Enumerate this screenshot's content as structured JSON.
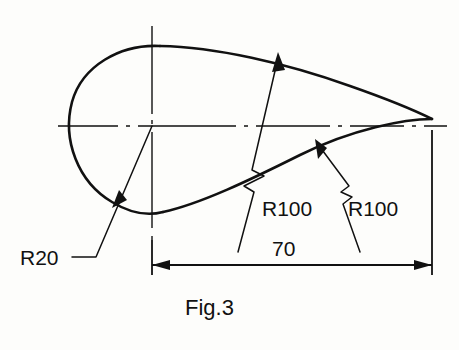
{
  "figure": {
    "caption": "Fig.3",
    "background_color": "#fdfdfb",
    "line_color": "#111111"
  },
  "annotations": {
    "radius_small_label": "R20",
    "radius_upper_label": "R100",
    "radius_lower_label": "R100",
    "length_label": "70"
  },
  "geometry": {
    "circle": {
      "center_x": 152,
      "center_y": 126,
      "radius": 80
    },
    "tip": {
      "x": 432,
      "y": 119
    },
    "overall_length": 70
  }
}
